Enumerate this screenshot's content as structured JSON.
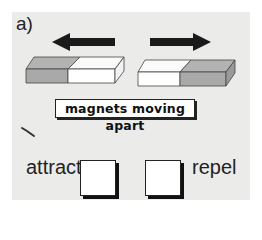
{
  "question": {
    "part_label": "a)",
    "caption": "magnets moving apart",
    "options": [
      {
        "id": "attract",
        "label": "attract",
        "checked": false
      },
      {
        "id": "repel",
        "label": "repel",
        "checked": false
      }
    ]
  },
  "diagram": {
    "left_magnet": {
      "left_pole_color": "#a9a9a9",
      "right_pole_color": "#ffffff",
      "motion": "left"
    },
    "right_magnet": {
      "left_pole_color": "#ffffff",
      "right_pole_color": "#a9a9a9",
      "motion": "right"
    },
    "arrow_color": "#1a1a1a"
  },
  "colors": {
    "panel_background": "#ebebea",
    "pole_gray": "#a9a9a9",
    "pole_gray_top": "#b3b3b3"
  }
}
